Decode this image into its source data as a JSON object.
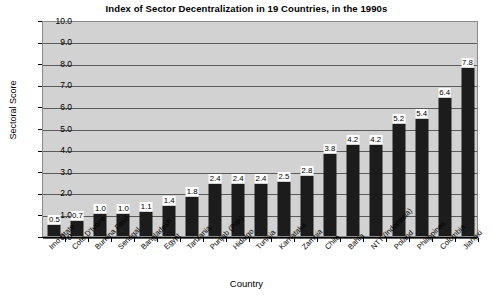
{
  "chart_data": {
    "type": "bar",
    "title": "Index of Sector Decentralization in 19 Countries, in the 1990s",
    "xlabel": "Country",
    "ylabel": "Sectoral Score",
    "ylim": [
      0,
      10
    ],
    "ytick_step": 1,
    "grid": true,
    "legend": "none",
    "categories": [
      "Imo State",
      "Cote D'Ivoire",
      "Burkina Faso",
      "Senegal",
      "Bangladesh",
      "Egypt",
      "Tanzania",
      "Punjab (Pak)",
      "Hidalgo",
      "Tunisia",
      "Karnataka",
      "Zambia",
      "Chile",
      "Bahia",
      "NTT (Indonesia)",
      "Poland",
      "Philippines",
      "Colombia",
      "Jiangxi"
    ],
    "values": [
      0.5,
      0.7,
      1.0,
      1.0,
      1.1,
      1.4,
      1.8,
      2.4,
      2.4,
      2.4,
      2.5,
      2.8,
      3.8,
      4.2,
      4.2,
      5.2,
      5.4,
      6.4,
      7.8
    ],
    "value_labels": [
      "0.5",
      "0.7",
      "1.0",
      "1.0",
      "1.1",
      "1.4",
      "1.8",
      "2.4",
      "2.4",
      "2.4",
      "2.5",
      "2.8",
      "3.8",
      "4.2",
      "4.2",
      "5.2",
      "5.4",
      "6.4",
      "7.8"
    ],
    "ytick_labels": [
      "10.0",
      "9.0",
      "8.0",
      "7.0",
      "6.0",
      "5.0",
      "4.0",
      "3.0",
      "2.0",
      "1.0",
      "0.0"
    ],
    "colors": {
      "bar": "#1c1c1c",
      "plot_background": "#d2d2d2",
      "gridline": "#5a5a5a",
      "axis": "#000000",
      "page_background": "#ffffff",
      "value_label_background": "#ffffff",
      "text": "#000000"
    }
  }
}
